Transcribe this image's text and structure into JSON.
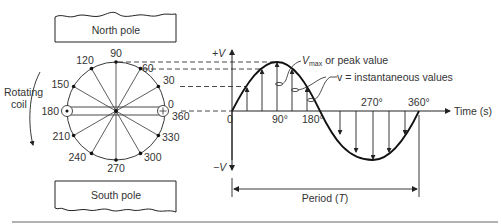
{
  "diagram": {
    "poles": {
      "north": "North pole",
      "south": "South pole"
    },
    "coil": {
      "label_line1": "Rotating",
      "label_line2": "coil",
      "left_conductor_symbol": "dot",
      "right_conductor_symbol": "cross"
    },
    "angles": [
      {
        "deg": 0,
        "label": "0"
      },
      {
        "deg": 30,
        "label": "30"
      },
      {
        "deg": 60,
        "label": "60"
      },
      {
        "deg": 90,
        "label": "90"
      },
      {
        "deg": 120,
        "label": "120"
      },
      {
        "deg": 150,
        "label": "150"
      },
      {
        "deg": 180,
        "label": "180"
      },
      {
        "deg": 210,
        "label": "210"
      },
      {
        "deg": 240,
        "label": "240"
      },
      {
        "deg": 270,
        "label": "270"
      },
      {
        "deg": 300,
        "label": "300"
      },
      {
        "deg": 330,
        "label": "330"
      },
      {
        "deg": 360,
        "label": "360"
      }
    ],
    "waveform": {
      "y_pos_label": "+V",
      "y_neg_label": "−V",
      "origin_label": "0",
      "x_axis_label": "Time (s)",
      "tick_labels": {
        "d90": "90°",
        "d180": "180°",
        "d270": "270°",
        "d360": "360°"
      },
      "annotation_peak_main": "V",
      "annotation_peak_sub": "max",
      "annotation_peak_rest": " or peak value",
      "annotation_instant": "v = instantaneous values",
      "period_label": "Period (",
      "period_symbol": "T",
      "period_close": ")"
    },
    "colors": {
      "line": "#222222",
      "text": "#333333",
      "background": "#ffffff"
    }
  }
}
